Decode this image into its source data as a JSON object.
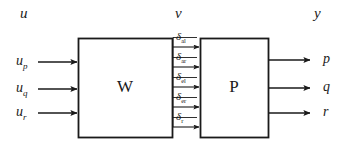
{
  "diagram": {
    "background": "#ffffff",
    "stroke": "#1a1a1a",
    "group_labels": [
      {
        "name": "input-group-label",
        "text": "u",
        "x": 20,
        "y": 6
      },
      {
        "name": "intermediate-group-label",
        "text": "v",
        "x": 175,
        "y": 6
      },
      {
        "name": "output-group-label",
        "text": "y",
        "x": 314,
        "y": 6
      }
    ],
    "blocks": [
      {
        "name": "block-w",
        "label": "W",
        "x": 78,
        "y": 38,
        "w": 94,
        "h": 99
      },
      {
        "name": "block-p",
        "label": "P",
        "x": 200,
        "y": 38,
        "w": 68,
        "h": 99
      }
    ],
    "inputs": [
      {
        "name": "input-signal-up",
        "base": "u",
        "sub": "p",
        "label_x": 16,
        "label_y": 54,
        "arrow_y": 62,
        "x1": 38,
        "x2": 77
      },
      {
        "name": "input-signal-uq",
        "base": "u",
        "sub": "q",
        "label_x": 16,
        "label_y": 81,
        "arrow_y": 89,
        "x1": 38,
        "x2": 77
      },
      {
        "name": "input-signal-ur",
        "base": "u",
        "sub": "r",
        "label_x": 16,
        "label_y": 105,
        "arrow_y": 113,
        "x1": 38,
        "x2": 77
      }
    ],
    "intermediate": [
      {
        "name": "signal-delta-al",
        "base": "δ",
        "sub": "al",
        "label_x": 176,
        "label_y": 31,
        "arrow_y": 47,
        "x1": 173,
        "x2": 199
      },
      {
        "name": "signal-delta-ar",
        "base": "δ",
        "sub": "ar",
        "label_x": 176,
        "label_y": 51,
        "arrow_y": 67,
        "x1": 173,
        "x2": 199
      },
      {
        "name": "signal-delta-el",
        "base": "δ",
        "sub": "el",
        "label_x": 176,
        "label_y": 71,
        "arrow_y": 87,
        "x1": 173,
        "x2": 199
      },
      {
        "name": "signal-delta-er",
        "base": "δ",
        "sub": "er",
        "label_x": 176,
        "label_y": 91,
        "arrow_y": 107,
        "x1": 173,
        "x2": 199
      },
      {
        "name": "signal-delta-r",
        "base": "δ",
        "sub": "r",
        "label_x": 176,
        "label_y": 111,
        "arrow_y": 127,
        "x1": 173,
        "x2": 199
      }
    ],
    "outputs": [
      {
        "name": "output-signal-p",
        "label": "p",
        "label_x": 323,
        "label_y": 52,
        "arrow_y": 60,
        "x1": 269,
        "x2": 310
      },
      {
        "name": "output-signal-q",
        "label": "q",
        "label_x": 323,
        "label_y": 80,
        "arrow_y": 88,
        "x1": 269,
        "x2": 310
      },
      {
        "name": "output-signal-r",
        "label": "r",
        "label_x": 323,
        "label_y": 105,
        "arrow_y": 113,
        "x1": 269,
        "x2": 310
      }
    ]
  }
}
